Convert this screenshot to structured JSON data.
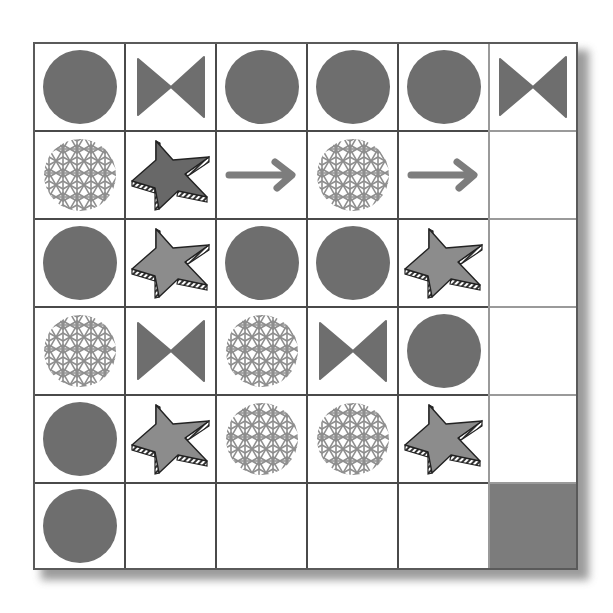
{
  "puzzle": {
    "rows": 6,
    "cols": 6,
    "colors": {
      "solid_shape": "#6e6e6e",
      "star_light": "#8c8c8c",
      "star_dark": "#686868",
      "pattern_stroke": "#8e8e8e",
      "arrow": "#7d7d7d",
      "grid_line": "#4a4a4a",
      "grid_line_light": "#9a9a9a",
      "filled_cell": "#7c7c7c"
    },
    "cells": [
      [
        "circle",
        "bowtie",
        "circle",
        "circle",
        "circle",
        "bowtie"
      ],
      [
        "pattern-circle",
        "star-dark",
        "arrow",
        "pattern-circle",
        "arrow",
        "empty"
      ],
      [
        "circle",
        "star",
        "circle",
        "circle",
        "star",
        "empty"
      ],
      [
        "pattern-circle",
        "bowtie",
        "pattern-circle",
        "bowtie",
        "circle",
        "empty"
      ],
      [
        "circle",
        "star",
        "pattern-circle",
        "pattern-circle",
        "star",
        "empty"
      ],
      [
        "circle",
        "empty",
        "empty",
        "empty",
        "empty",
        "filled"
      ]
    ]
  }
}
